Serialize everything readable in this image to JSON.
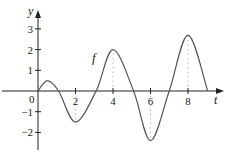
{
  "chart_data": {
    "type": "line",
    "title": "",
    "xlabel": "t",
    "ylabel": "y",
    "curve_label": "f",
    "xlim": [
      -0.5,
      10
    ],
    "ylim": [
      -2.8,
      3.8
    ],
    "x_ticks": [
      2,
      4,
      6,
      8
    ],
    "x_tick_labels": [
      "2",
      "4",
      "6",
      "8"
    ],
    "y_ticks": [
      -2,
      -1,
      1,
      2,
      3
    ],
    "y_tick_labels": [
      "−2",
      "−1",
      "1",
      "2",
      "3"
    ],
    "origin_label": "0",
    "grid": false,
    "legend": null,
    "series": [
      {
        "name": "f",
        "x": [
          0,
          0.5,
          1.1,
          2,
          3.1,
          4,
          5.1,
          6,
          7.0,
          8,
          9.05
        ],
        "y": [
          0,
          0.5,
          0,
          -1.5,
          0,
          2,
          0,
          -2.4,
          0,
          2.7,
          0
        ]
      }
    ],
    "dotted_verticals": [
      {
        "x": 2,
        "y": -1.5
      },
      {
        "x": 4,
        "y": 2
      },
      {
        "x": 6,
        "y": -2.4
      },
      {
        "x": 8,
        "y": 2.7
      }
    ],
    "colors": {
      "axis": "#222222",
      "curve": "#555555",
      "dotted": "#bbbbbb"
    }
  }
}
